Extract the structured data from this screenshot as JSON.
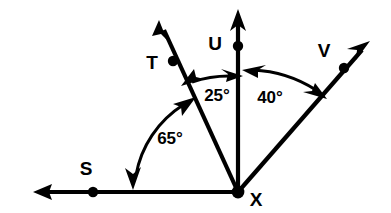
{
  "figure": {
    "type": "geometry-diagram",
    "background_color": "#ffffff",
    "stroke_color": "#000000",
    "width": 391,
    "height": 213,
    "vertex": {
      "label": "X",
      "x": 238,
      "y": 192
    },
    "points": [
      {
        "name": "point-s",
        "label": "S",
        "dot_x": 93,
        "dot_y": 192,
        "label_x": 86,
        "label_y": 170
      },
      {
        "name": "point-t",
        "label": "T",
        "dot_x": 173,
        "dot_y": 61,
        "label_x": 152,
        "label_y": 64
      },
      {
        "name": "point-u",
        "label": "U",
        "dot_x": 238,
        "dot_y": 46,
        "label_x": 215,
        "label_y": 45
      },
      {
        "name": "point-v",
        "label": "V",
        "dot_x": 344,
        "dot_y": 68,
        "label_x": 324,
        "label_y": 52
      },
      {
        "name": "point-x",
        "label": "X",
        "dot_x": 238,
        "dot_y": 192,
        "label_x": 256,
        "label_y": 201
      }
    ],
    "rays": [
      {
        "name": "ray-xs",
        "through": "S",
        "tip_x": 33,
        "tip_y": 192,
        "direction_deg": 180
      },
      {
        "name": "ray-xt",
        "through": "T",
        "tip_x": 159,
        "tip_y": 20,
        "direction_deg": 115
      },
      {
        "name": "ray-xu",
        "through": "U",
        "tip_x": 238,
        "tip_y": 9,
        "direction_deg": 90
      },
      {
        "name": "ray-xv",
        "through": "V",
        "tip_x": 370,
        "tip_y": 41,
        "direction_deg": 49
      }
    ],
    "angles": [
      {
        "name": "angle-sxt",
        "label": "65°",
        "value": 65,
        "unit": "degrees",
        "between": [
          "S",
          "T"
        ],
        "radius": 105,
        "label_x": 170,
        "label_y": 140
      },
      {
        "name": "angle-txu",
        "label": "25°",
        "value": 25,
        "unit": "degrees",
        "between": [
          "T",
          "U"
        ],
        "radius": 116,
        "label_x": 217,
        "label_y": 97
      },
      {
        "name": "angle-uxv",
        "label": "40°",
        "value": 40,
        "unit": "degrees",
        "between": [
          "U",
          "V"
        ],
        "radius": 127,
        "label_x": 270,
        "label_y": 99
      }
    ]
  }
}
